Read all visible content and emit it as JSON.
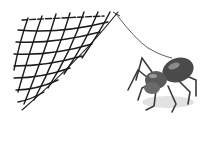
{
  "illustration": {
    "description": "Pencil sketch of a spider hanging from a thread attached to a corner spider web",
    "subjects": [
      "spider web",
      "spider",
      "silk thread"
    ],
    "colors": {
      "background": "#ffffff",
      "web": "#1a1a1a",
      "spider_body": "#4a4a4a",
      "spider_highlight": "#8a8a8a",
      "shadow": "#d6d6d6"
    }
  }
}
